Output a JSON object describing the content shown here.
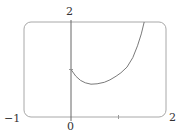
{
  "chart_data": {
    "type": "line",
    "title": "",
    "xlabel": "",
    "ylabel": "",
    "xlim": [
      -1,
      2
    ],
    "ylim": [
      0,
      2
    ],
    "grid": false,
    "legend": null,
    "frame": "rounded-rectangle viewing window",
    "tick_labels": {
      "x_min": "−1",
      "x_zero": "0",
      "x_max": "2",
      "y_max": "2"
    },
    "series": [
      {
        "name": "curve",
        "x": [
          0,
          0.1,
          0.2,
          0.3,
          0.42,
          0.55,
          0.7,
          0.82,
          0.95,
          1.05,
          1.18,
          1.3,
          1.4,
          1.48,
          1.54
        ],
        "y": [
          1.0,
          0.86,
          0.77,
          0.72,
          0.69,
          0.7,
          0.73,
          0.78,
          0.86,
          0.93,
          1.05,
          1.25,
          1.5,
          1.75,
          2.0
        ]
      }
    ],
    "colors": {
      "frame": "#9a9a9a",
      "curve": "#7a7a7a",
      "axis": "#555555"
    }
  }
}
